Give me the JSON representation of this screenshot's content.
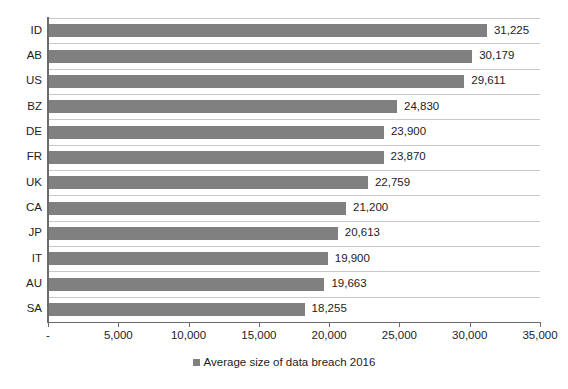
{
  "chart_data": {
    "type": "bar",
    "orientation": "horizontal",
    "title": "",
    "xlabel": "",
    "ylabel": "",
    "xlim": [
      0,
      35000
    ],
    "grid": true,
    "legend_position": "bottom",
    "categories": [
      "ID",
      "AB",
      "US",
      "BZ",
      "DE",
      "FR",
      "UK",
      "CA",
      "JP",
      "IT",
      "AU",
      "SA"
    ],
    "values": [
      31225,
      30179,
      29611,
      24830,
      23900,
      23870,
      22759,
      21200,
      20613,
      19900,
      19663,
      18255
    ],
    "value_labels": [
      "31,225",
      "30,179",
      "29,611",
      "24,830",
      "23,900",
      "23,870",
      "22,759",
      "21,200",
      "20,613",
      "19,900",
      "19,663",
      "18,255"
    ],
    "series": [
      {
        "name": "Average size of data breach 2016",
        "color": "#808080",
        "values": [
          31225,
          30179,
          29611,
          24830,
          23900,
          23870,
          22759,
          21200,
          20613,
          19900,
          19663,
          18255
        ]
      }
    ],
    "xticks": [
      0,
      5000,
      10000,
      15000,
      20000,
      25000,
      30000,
      35000
    ],
    "xtick_labels": [
      "-",
      "5,000",
      "10,000",
      "15,000",
      "20,000",
      "25,000",
      "30,000",
      "35,000"
    ],
    "legend": [
      "Average size of data breach 2016"
    ]
  },
  "colors": {
    "bar": "#808080",
    "gridline": "#c9c9c9",
    "axis": "#6b6b6b",
    "text": "#1c1c1c",
    "background": "#ffffff"
  }
}
